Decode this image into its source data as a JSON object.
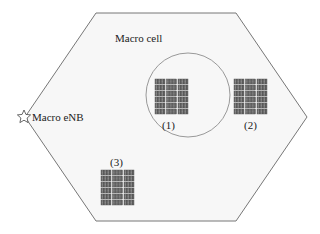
{
  "diagram": {
    "title": "Macro cell",
    "enb_label": "Macro eNB",
    "clusters": [
      {
        "id": 1,
        "label": "(1)",
        "encircled": true
      },
      {
        "id": 2,
        "label": "(2)",
        "encircled": false
      },
      {
        "id": 3,
        "label": "(3)",
        "encircled": false
      }
    ],
    "colors": {
      "hexagon_fill": "#f7f7f7",
      "hexagon_stroke": "#777777",
      "circle_stroke": "#999999",
      "building_dark": "#555555",
      "building_light": "#bbbbbb",
      "text": "#222222"
    }
  }
}
